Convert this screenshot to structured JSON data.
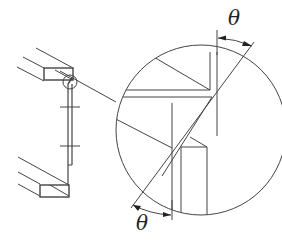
{
  "diagram": {
    "type": "technical-drawing",
    "labels": {
      "angle_top": "θ",
      "angle_bottom": "θ"
    },
    "colors": {
      "stroke": "#444444",
      "background": "#ffffff",
      "text": "#222222"
    }
  }
}
